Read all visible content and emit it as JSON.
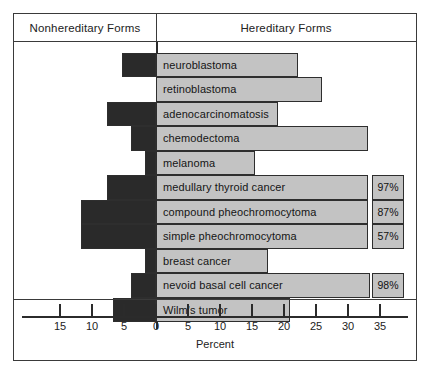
{
  "header": {
    "left_label": "Nonhereditary Forms",
    "right_label": "Hereditary Forms"
  },
  "axis": {
    "title": "Percent",
    "tick_labels": [
      "15",
      "10",
      "5",
      "0",
      "5",
      "10",
      "15",
      "20",
      "25",
      "30",
      "35"
    ],
    "tick_values": [
      -15,
      -10,
      -5,
      0,
      5,
      10,
      15,
      20,
      25,
      30,
      35
    ]
  },
  "colors": {
    "hereditary_bar": "#c3c3c3",
    "nonhereditary_bar": "#2a2a2a",
    "frame": "#3a3a3a",
    "background": "#ffffff"
  },
  "chart_data": {
    "type": "bar",
    "orientation": "horizontal-diverging",
    "title": "",
    "xlabel": "Percent",
    "ylabel": "",
    "xlim": [
      -17.5,
      40
    ],
    "grid": false,
    "legend": [
      "Nonhereditary Forms",
      "Hereditary Forms"
    ],
    "categories": [
      "neuroblastoma",
      "retinoblastoma",
      "adenocarcinomatosis",
      "chemodectoma",
      "melanoma",
      "medullary thyroid cancer",
      "compound pheochromocytoma",
      "simple pheochromocytoma",
      "breast cancer",
      "nevoid basal cell cancer",
      "Wilm's tumor"
    ],
    "series": [
      {
        "name": "Nonhereditary Forms",
        "values": [
          5.3,
          0,
          7.7,
          3.9,
          1.7,
          7.7,
          11.7,
          11.7,
          1.7,
          3.9,
          6.7
        ]
      },
      {
        "name": "Hereditary Forms",
        "values": [
          22.2,
          26.0,
          19.1,
          33.1,
          15.5,
          33.1,
          33.1,
          33.1,
          17.5,
          33.4,
          21.0
        ]
      }
    ],
    "annotations": [
      {
        "category": "medullary thyroid cancer",
        "label": "97%"
      },
      {
        "category": "compound pheochromocytoma",
        "label": "87%"
      },
      {
        "category": "simple pheochromocytoma",
        "label": "57%"
      },
      {
        "category": "nevoid basal cell cancer",
        "label": "98%"
      }
    ]
  }
}
